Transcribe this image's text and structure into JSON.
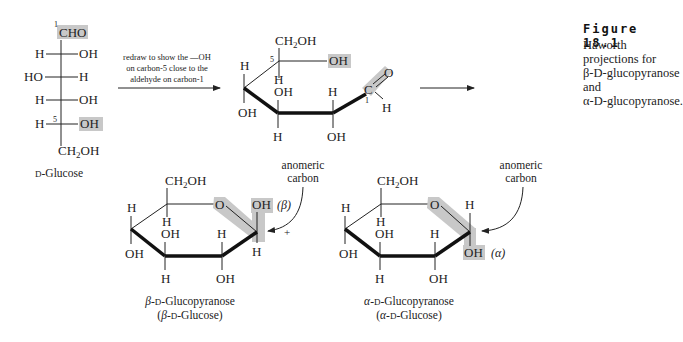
{
  "figure": {
    "title": "Figure 18.1",
    "caption_line1": "Haworth projections for",
    "caption_line2": "β-D-glucopyranose and",
    "caption_line3": "α-D-glucopyranose."
  },
  "fischer": {
    "top_label": "CHO",
    "carbon1_number": "1",
    "carbon5_number": "5",
    "rows": [
      {
        "left": "H",
        "right": "OH"
      },
      {
        "left": "HO",
        "right": "H"
      },
      {
        "left": "H",
        "right": "OH"
      },
      {
        "left": "H",
        "right": "OH"
      }
    ],
    "bottom_label": "CH₂OH",
    "name": "D-Glucose"
  },
  "arrow1": {
    "line1": "redraw to show the —OH",
    "line2": "on carbon-5 close to the",
    "line3": "aldehyde on carbon-1"
  },
  "open_chain": {
    "ch2oh": "CH₂OH",
    "c5_number": "5",
    "c5_oh": "OH",
    "c5_h": "H",
    "c4_h": "H",
    "c4_oh": "OH",
    "c3_oh": "OH",
    "c3_h": "H",
    "c2_h": "H",
    "c2_oh": "OH",
    "c1_label": "C",
    "c1_o": "O",
    "c1_h": "H",
    "c1_number": "1"
  },
  "beta": {
    "ch2oh": "CH₂OH",
    "ring_o": "O",
    "c4_h": "H",
    "c4_oh": "OH",
    "c5_h": "H",
    "c3_oh": "OH",
    "c3_h": "H",
    "c2_h": "H",
    "c2_oh": "OH",
    "c1_top": "OH",
    "c1_bottom": "H",
    "anomer_tag": "(β)",
    "anomeric_label_1": "anomeric",
    "anomeric_label_2": "carbon",
    "plus": "+",
    "name1": "β-D-Glucopyranose",
    "name2": "(β-D-Glucose)"
  },
  "alpha": {
    "ch2oh": "CH₂OH",
    "ring_o": "O",
    "c4_h": "H",
    "c4_oh": "OH",
    "c5_h": "H",
    "c3_oh": "OH",
    "c3_h": "H",
    "c2_h": "H",
    "c2_oh": "OH",
    "c1_top": "H",
    "c1_bottom": "OH",
    "anomer_tag": "(α)",
    "anomeric_label_1": "anomeric",
    "anomeric_label_2": "carbon",
    "name1": "α-D-Glucopyranose",
    "name2": "(α-D-Glucose)"
  },
  "colors": {
    "highlight": "#c8c8c8",
    "ink": "#222222"
  }
}
